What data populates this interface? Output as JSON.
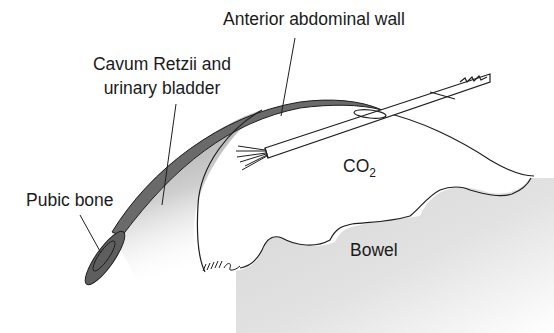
{
  "labels": {
    "anterior_wall": "Anterior abdominal wall",
    "cavum_line1": "Cavum Retzii and",
    "cavum_line2": "urinary bladder",
    "pubic_bone": "Pubic bone",
    "co2_main": "CO",
    "co2_sub": "2",
    "bowel": "Bowel"
  },
  "colors": {
    "line": "#1e1e1e",
    "wall_fill": "#6a6a6a",
    "pubic_fill": "#5e5e5e",
    "shade": "#c8c8c8"
  }
}
